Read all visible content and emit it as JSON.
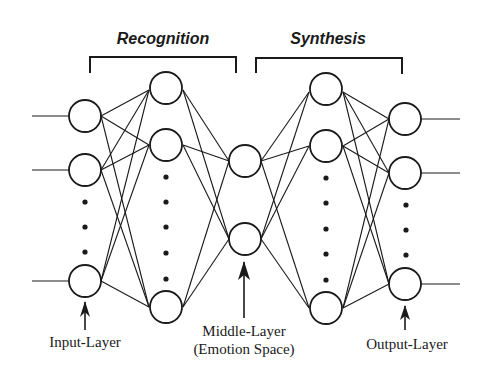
{
  "diagram": {
    "type": "autoencoder-neural-network",
    "groups": [
      {
        "label": "Recognition"
      },
      {
        "label": "Synthesis"
      }
    ],
    "layers": [
      {
        "name": "input",
        "caption": "Input-Layer"
      },
      {
        "name": "hidden-recognition"
      },
      {
        "name": "middle",
        "caption_line1": "Middle-Layer",
        "caption_line2": "(Emotion Space)"
      },
      {
        "name": "hidden-synthesis"
      },
      {
        "name": "output",
        "caption": "Output-Layer"
      }
    ],
    "colors": {
      "ink": "#1a1a1a",
      "background": "#ffffff"
    }
  }
}
